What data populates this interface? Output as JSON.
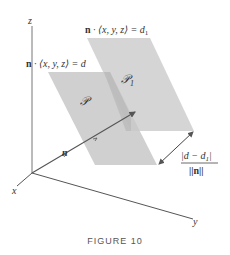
{
  "figure": {
    "caption": "FIGURE 10",
    "axes": {
      "x": "x",
      "y": "y",
      "z": "z"
    },
    "planes": [
      {
        "name": "P",
        "label": "𝒫",
        "equation_prefix": "n",
        "equation": " · ⟨x, y, z⟩ = d"
      },
      {
        "name": "P1",
        "label": "𝒫",
        "label_sub": "1",
        "equation_prefix": "n",
        "equation": " · ⟨x, y, z⟩ = d",
        "equation_sub": "1"
      }
    ],
    "normal_vector_label": "n",
    "distance_formula": {
      "numerator": "|d − d",
      "numerator_sub": "1",
      "numerator_end": "|",
      "denominator": "||n||"
    },
    "colors": {
      "plane_fill": "#c8c8c8",
      "plane_overlap": "#b0b0b0",
      "line": "#555555"
    }
  }
}
